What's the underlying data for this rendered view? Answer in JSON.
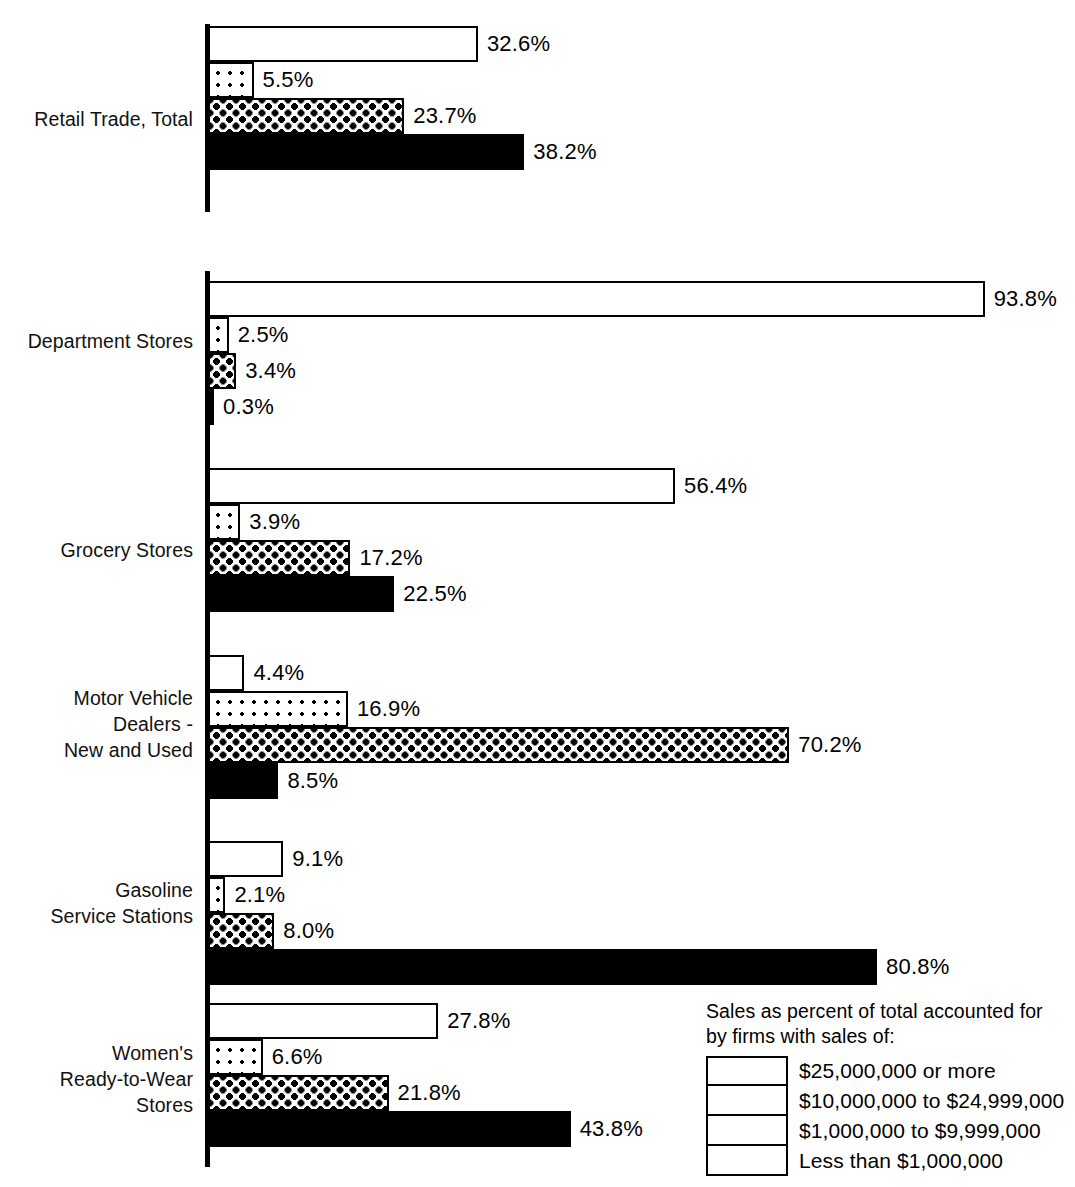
{
  "chart_data": {
    "type": "bar",
    "orientation": "horizontal",
    "title": "",
    "subtitle": "",
    "xlabel": "",
    "ylabel": "",
    "xlim": [
      0,
      100
    ],
    "grid": false,
    "value_suffix": "%",
    "legend_position": "bottom-right",
    "categories": [
      "Retail Trade, Total",
      "Department Stores",
      "Grocery Stores",
      "Motor Vehicle\nDealers -\nNew and Used",
      "Gasoline\nService Stations",
      "Women's\nReady-to-Wear\nStores"
    ],
    "series": [
      {
        "name": "$25,000,000 or more",
        "pattern": "white",
        "values": [
          32.6,
          93.8,
          56.4,
          4.4,
          9.1,
          27.8
        ],
        "labels": [
          "32.6%",
          "93.8%",
          "56.4%",
          "4.4%",
          "9.1%",
          "27.8%"
        ]
      },
      {
        "name": "$10,000,000 to $24,999,000",
        "pattern": "sparse-dots",
        "values": [
          5.5,
          2.5,
          3.9,
          16.9,
          2.1,
          6.6
        ],
        "labels": [
          "5.5%",
          "2.5%",
          "3.9%",
          "16.9%",
          "2.1%",
          "6.6%"
        ]
      },
      {
        "name": "$1,000,000 to $9,999,000",
        "pattern": "dense-dots",
        "values": [
          23.7,
          3.4,
          17.2,
          70.2,
          8.0,
          21.8
        ],
        "labels": [
          "23.7%",
          "3.4%",
          "17.2%",
          "70.2%",
          "8.0%",
          "21.8%"
        ]
      },
      {
        "name": "Less than $1,000,000",
        "pattern": "solid-black",
        "values": [
          38.2,
          0.3,
          22.5,
          8.5,
          80.8,
          43.8
        ],
        "labels": [
          "38.2%",
          "0.3%",
          "22.5%",
          "8.5%",
          "80.8%",
          "43.8%"
        ]
      }
    ]
  },
  "legend": {
    "caption": "Sales as percent of total accounted for\nby firms with sales of:",
    "items": [
      {
        "label": "$25,000,000 or more",
        "pattern": "white"
      },
      {
        "label": "$10,000,000 to $24,999,000",
        "pattern": "sparse-dots"
      },
      {
        "label": "$1,000,000 to $9,999,000",
        "pattern": "dense-dots"
      },
      {
        "label": "Less than $1,000,000",
        "pattern": "solid-black"
      }
    ]
  },
  "layout": {
    "axis_x": 208,
    "px_per_percent": 8.28,
    "bar_height": 36,
    "groups": [
      {
        "index": 0,
        "top": 26,
        "label_top": 106,
        "axis_top": 24,
        "axis_height": 188
      },
      {
        "index": 1,
        "top": 281,
        "label_top": 328,
        "axis_top": 271,
        "axis_height": 178
      },
      {
        "index": 2,
        "top": 468,
        "label_top": 537,
        "axis_top": 449,
        "axis_height": 190
      },
      {
        "index": 3,
        "top": 655,
        "label_top": 685,
        "axis_top": 639,
        "axis_height": 189
      },
      {
        "index": 4,
        "top": 841,
        "label_top": 877,
        "axis_top": 828,
        "axis_height": 190
      },
      {
        "index": 5,
        "top": 1003,
        "label_top": 1040,
        "axis_top": 1000,
        "axis_height": 167
      }
    ]
  },
  "colors": {
    "ink": "#000000",
    "paper": "#ffffff"
  }
}
